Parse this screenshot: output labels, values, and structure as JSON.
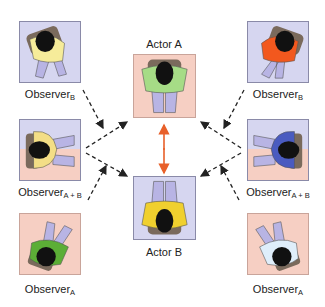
{
  "actors": {
    "a": {
      "label": "Actor A",
      "shirt_color": "#a6dc86"
    },
    "b": {
      "label": "Actor B",
      "shirt_color": "#f0d02e"
    }
  },
  "observers": {
    "left_top": {
      "base": "Observer",
      "sub": "B",
      "shirt_color": "#f6ec9a"
    },
    "left_mid": {
      "base": "Observer",
      "sub": "A + B",
      "shirt_color": "#f3de86"
    },
    "left_bot": {
      "base": "Observer",
      "sub": "A",
      "shirt_color": "#5cae36"
    },
    "right_top": {
      "base": "Observer",
      "sub": "B",
      "shirt_color": "#f2581e"
    },
    "right_mid": {
      "base": "Observer",
      "sub": "A + B",
      "shirt_color": "#4a5bc0"
    },
    "right_bot": {
      "base": "Observer",
      "sub": "A",
      "shirt_color": "#dfeefa"
    }
  },
  "colors": {
    "actor_a_bg": "#f6cfc3",
    "actor_b_bg": "#d6d6f0",
    "interaction_arrow": "#e8602a",
    "gaze_arrow": "#222222",
    "pants": "#b8b4e4"
  }
}
